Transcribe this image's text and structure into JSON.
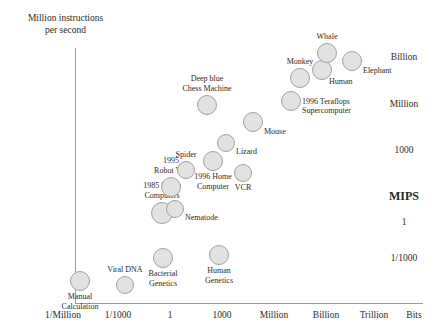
{
  "chart_data": {
    "type": "scatter",
    "title": "",
    "ylabel_lines": [
      "Million instructions",
      "per second"
    ],
    "ylabel": "MIPS",
    "xlabel": "Bits",
    "y_ticks": [
      "Billion",
      "Million",
      "1000",
      "MIPS",
      "1",
      "1/1000"
    ],
    "x_ticks": [
      "1/Million",
      "1/1000",
      "1",
      "1000",
      "Million",
      "Billion",
      "Trillion",
      "Bits"
    ],
    "grid": false,
    "legend": "none",
    "points": [
      {
        "label_lines": [
          "Manual",
          "Calculation"
        ],
        "label_pos": "below-center",
        "x_px": 80,
        "y_px": 281,
        "r_px": 10
      },
      {
        "label_lines": [
          "Viral DNA"
        ],
        "label_pos": "above-center",
        "x_px": 125,
        "y_px": 285,
        "r_px": 9
      },
      {
        "label_lines": [
          "Bacterial",
          "Genetics"
        ],
        "label_pos": "below-center",
        "x_px": 163,
        "y_px": 258,
        "r_px": 10
      },
      {
        "label_lines": [
          "Human",
          "Genetics"
        ],
        "label_pos": "below-center",
        "x_px": 219,
        "y_px": 255,
        "r_px": 10
      },
      {
        "label_lines": [
          "1985 Home",
          "Computers"
        ],
        "label_pos": "above-center",
        "x_px": 162,
        "y_px": 213,
        "r_px": 11
      },
      {
        "label_lines": [
          "Nematode"
        ],
        "label_pos": "right",
        "x_px": 175,
        "y_px": 209,
        "r_px": 9
      },
      {
        "label_lines": [
          "1995",
          "Robot Van"
        ],
        "label_pos": "above-center",
        "x_px": 171,
        "y_px": 187,
        "r_px": 10
      },
      {
        "label_lines": [
          "Spider"
        ],
        "label_pos": "above-center",
        "x_px": 186,
        "y_px": 170,
        "r_px": 9
      },
      {
        "label_lines": [
          "1996 Home",
          "Computer"
        ],
        "label_pos": "below-center",
        "x_px": 213,
        "y_px": 161,
        "r_px": 10
      },
      {
        "label_lines": [
          "VCR"
        ],
        "label_pos": "below-center",
        "x_px": 243,
        "y_px": 173,
        "r_px": 9
      },
      {
        "label_lines": [
          "Lizard"
        ],
        "label_pos": "right",
        "x_px": 226,
        "y_px": 143,
        "r_px": 9
      },
      {
        "label_lines": [
          "Mouse"
        ],
        "label_pos": "right",
        "x_px": 253,
        "y_px": 122,
        "r_px": 10
      },
      {
        "label_lines": [
          "Deep blue",
          "Chess Machine"
        ],
        "label_pos": "above-center",
        "x_px": 207,
        "y_px": 105,
        "r_px": 10
      },
      {
        "label_lines": [
          "1996 Teraflops",
          "Supercomputer"
        ],
        "label_pos": "right",
        "x_px": 291,
        "y_px": 101,
        "r_px": 10
      },
      {
        "label_lines": [
          "Monkey"
        ],
        "label_pos": "above-center",
        "x_px": 300,
        "y_px": 78,
        "r_px": 10
      },
      {
        "label_lines": [
          "Human"
        ],
        "label_pos": "below-right",
        "x_px": 322,
        "y_px": 70,
        "r_px": 10
      },
      {
        "label_lines": [
          "Whale"
        ],
        "label_pos": "above-center",
        "x_px": 327,
        "y_px": 53,
        "r_px": 10
      },
      {
        "label_lines": [
          "Elephant"
        ],
        "label_pos": "right",
        "x_px": 352,
        "y_px": 61,
        "r_px": 10
      }
    ],
    "colors": {
      "bubble_fill": "#e2e2e2",
      "bubble_stroke": "#a0a0a0",
      "axis": "#9a9a9a",
      "text": "#2a2a2a",
      "background": "#ffffff"
    },
    "y_tick_positions_px": [
      57,
      104,
      150,
      196,
      222,
      258
    ],
    "x_tick_positions_px": [
      63,
      118,
      170,
      222,
      274,
      326,
      374,
      414
    ]
  }
}
